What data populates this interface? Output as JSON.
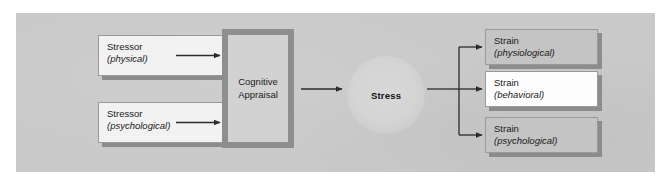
{
  "figure": {
    "panel_color": "#c9c9c9"
  },
  "nodes": {
    "stressor_physical": {
      "line1": "Stressor",
      "line2": "(physical)",
      "fill": "#f2f2f2"
    },
    "stressor_psychological": {
      "line1": "Stressor",
      "line2": "(psychological)",
      "fill": "#f2f2f2"
    },
    "cognitive_appraisal": {
      "line1": "Cognitive",
      "line2": "Appraisal",
      "fill": "#d2d2d2",
      "border_color": "#8e8e8e"
    },
    "stress": {
      "label": "Stress",
      "fill": "#d4d4d4"
    },
    "strain_physiological": {
      "line1": "Strain",
      "line2": "(physiological)",
      "fill": "#c4c4c4"
    },
    "strain_behavioral": {
      "line1": "Strain",
      "line2": "(behavioral)",
      "fill": "#fdfdfd"
    },
    "strain_psychological": {
      "line1": "Strain",
      "line2": "(psychological)",
      "fill": "#c4c4c4"
    }
  },
  "connectors": {
    "stroke_color": "#2b2b2b",
    "arrow_physical_to_appraisal": "Stressor (physical) to Cognitive Appraisal",
    "arrow_psychological_to_appraisal": "Stressor (psychological) to Cognitive Appraisal",
    "arrow_appraisal_to_stress": "Cognitive Appraisal to Stress",
    "arrow_stress_to_strains": "Stress to three Strain outcomes"
  }
}
